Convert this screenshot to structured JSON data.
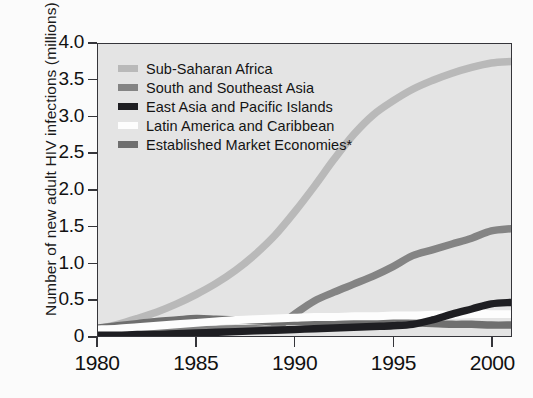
{
  "figure": {
    "ylabel": "Number of new adult HIV infections (millions)",
    "plot_bg": "#e4e4e4",
    "frame_color": "#35353a"
  },
  "chart_data": {
    "type": "line",
    "title": "",
    "xlabel": "",
    "ylabel": "Number of new adult HIV infections (millions)",
    "xlim": [
      1980,
      2001
    ],
    "ylim": [
      0,
      4.0
    ],
    "grid": false,
    "legend_position": "inside top-left",
    "xticks": [
      1980,
      1985,
      1990,
      1995,
      2000
    ],
    "xtick_labels": [
      "1980",
      "1985",
      "1990",
      "1995",
      "2000"
    ],
    "yticks": [
      0,
      0.5,
      1.0,
      1.5,
      2.0,
      2.5,
      3.0,
      3.5,
      4.0
    ],
    "ytick_labels": [
      "0",
      "0.5",
      "1.0",
      "1.5",
      "2.0",
      "2.5",
      "3.0",
      "3.5",
      "4.0"
    ],
    "x": [
      1980,
      1981,
      1982,
      1983,
      1984,
      1985,
      1986,
      1987,
      1988,
      1989,
      1990,
      1991,
      1992,
      1993,
      1994,
      1995,
      1996,
      1997,
      1998,
      1999,
      2000,
      2001
    ],
    "series": [
      {
        "name": "Sub-Saharan Africa",
        "color": "#b9b9b9",
        "values": [
          0.1,
          0.16,
          0.24,
          0.33,
          0.44,
          0.57,
          0.72,
          0.9,
          1.12,
          1.38,
          1.7,
          2.05,
          2.42,
          2.76,
          3.03,
          3.22,
          3.38,
          3.5,
          3.6,
          3.68,
          3.74,
          3.76
        ]
      },
      {
        "name": "South and Southeast Asia",
        "color": "#848484",
        "values": [
          0.08,
          0.08,
          0.08,
          0.08,
          0.09,
          0.09,
          0.09,
          0.1,
          0.1,
          0.11,
          0.3,
          0.48,
          0.6,
          0.71,
          0.82,
          0.95,
          1.1,
          1.18,
          1.26,
          1.34,
          1.44,
          1.47
        ]
      },
      {
        "name": "East Asia and Pacific Islands",
        "color": "#1e1e22",
        "values": [
          0.01,
          0.01,
          0.02,
          0.02,
          0.03,
          0.04,
          0.05,
          0.06,
          0.07,
          0.08,
          0.09,
          0.1,
          0.11,
          0.12,
          0.13,
          0.14,
          0.16,
          0.22,
          0.3,
          0.37,
          0.44,
          0.46
        ]
      },
      {
        "name": "Latin America and Caribbean",
        "color": "#fdfdfd",
        "values": [
          0.09,
          0.1,
          0.12,
          0.14,
          0.16,
          0.18,
          0.2,
          0.22,
          0.23,
          0.24,
          0.25,
          0.26,
          0.26,
          0.27,
          0.27,
          0.28,
          0.28,
          0.29,
          0.29,
          0.3,
          0.3,
          0.3
        ]
      },
      {
        "name": "Established Market Economies*",
        "color": "#6f6f6f",
        "values": [
          0.11,
          0.14,
          0.17,
          0.2,
          0.22,
          0.24,
          0.23,
          0.22,
          0.21,
          0.2,
          0.2,
          0.2,
          0.2,
          0.2,
          0.2,
          0.19,
          0.18,
          0.17,
          0.16,
          0.16,
          0.15,
          0.15
        ]
      }
    ]
  },
  "legend": {
    "items": [
      {
        "label": "Sub-Saharan Africa",
        "color": "#b9b9b9"
      },
      {
        "label": "South and Southeast Asia",
        "color": "#848484"
      },
      {
        "label": "East Asia and Pacific Islands",
        "color": "#1e1e22"
      },
      {
        "label": "Latin America and Caribbean",
        "color": "#fdfdfd"
      },
      {
        "label": "Established Market Economies*",
        "color": "#6f6f6f"
      }
    ]
  }
}
